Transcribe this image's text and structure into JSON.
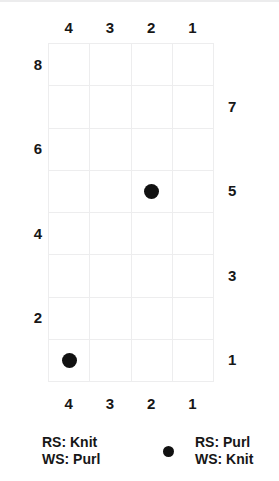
{
  "chart_data": {
    "type": "heatmap",
    "title": "",
    "subtitle": "",
    "xlabel": "",
    "ylabel": "",
    "grid": true,
    "legend_position": "bottom",
    "columns": 4,
    "rows": 8,
    "column_labels_top": [
      "4",
      "3",
      "2",
      "1"
    ],
    "column_labels_bottom": [
      "4",
      "3",
      "2",
      "1"
    ],
    "row_labels_left": [
      "8",
      "",
      "6",
      "",
      "4",
      "",
      "2",
      ""
    ],
    "row_labels_right": [
      "",
      "7",
      "",
      "5",
      "",
      "3",
      "",
      "1"
    ],
    "cell_symbols": [
      [
        "blank",
        "blank",
        "blank",
        "blank"
      ],
      [
        "blank",
        "blank",
        "blank",
        "blank"
      ],
      [
        "blank",
        "blank",
        "blank",
        "blank"
      ],
      [
        "blank",
        "dot",
        "blank",
        "blank"
      ],
      [
        "blank",
        "blank",
        "blank",
        "blank"
      ],
      [
        "blank",
        "blank",
        "blank",
        "blank"
      ],
      [
        "blank",
        "blank",
        "blank",
        "blank"
      ],
      [
        "dot",
        "blank",
        "blank",
        "blank"
      ]
    ],
    "marked_cells": [
      {
        "row": 5,
        "column": 2,
        "symbol": "dot"
      },
      {
        "row": 1,
        "column": 4,
        "symbol": "dot"
      }
    ],
    "colors": {
      "symbol": "#111111",
      "gridline": "#ededee",
      "background": "#ffffff",
      "text": "#171717"
    }
  },
  "legend": {
    "entries": [
      {
        "symbol": "blank",
        "line1": "RS: Knit",
        "line2": "WS: Purl"
      },
      {
        "symbol": "dot",
        "line1": "RS: Purl",
        "line2": "WS: Knit"
      }
    ]
  }
}
